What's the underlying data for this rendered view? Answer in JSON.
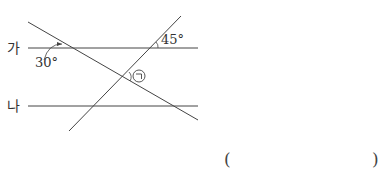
{
  "diagram": {
    "lines": {
      "ga": {
        "label": "가"
      },
      "na": {
        "label": "나"
      }
    },
    "angles": {
      "given_top_right": "45°",
      "given_top_left": "30°",
      "unknown": "㉠"
    },
    "colors": {
      "line": "#444444",
      "text": "#333333"
    }
  },
  "answer": {
    "open_paren": "(",
    "close_paren": ")",
    "value": ""
  }
}
